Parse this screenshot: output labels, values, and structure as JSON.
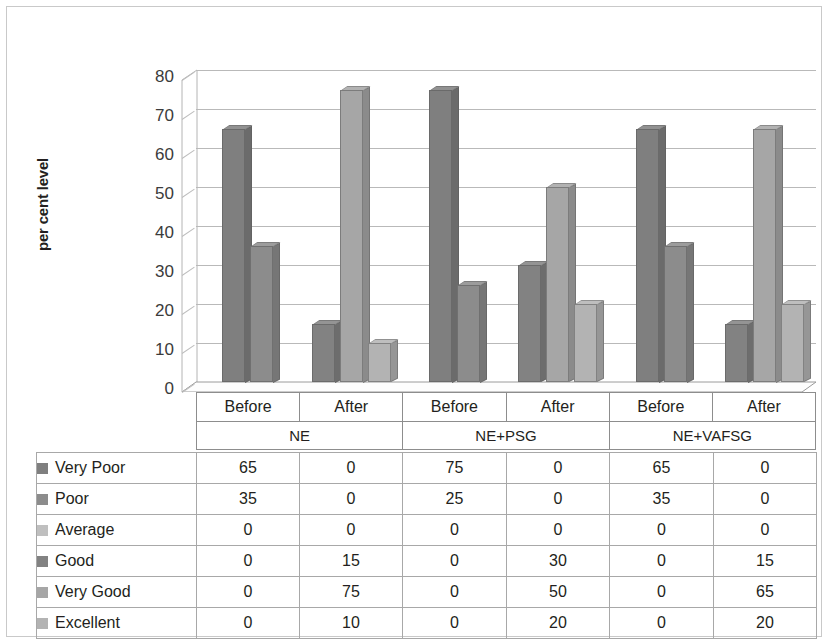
{
  "chart_data": {
    "type": "bar",
    "title": "",
    "subtitle": "",
    "xlabel": "",
    "ylabel": "per cent level",
    "ylim": [
      0,
      80
    ],
    "yticks": [
      0,
      10,
      20,
      30,
      40,
      50,
      60,
      70,
      80
    ],
    "grid": true,
    "legend_position": "data-table-below",
    "stacked": false,
    "three_d": true,
    "categories": [
      "Before",
      "After",
      "Before",
      "After",
      "Before",
      "After"
    ],
    "groups": [
      {
        "name": "NE",
        "categories": [
          "Before",
          "After"
        ]
      },
      {
        "name": "NE+PSG",
        "categories": [
          "Before",
          "After"
        ]
      },
      {
        "name": "NE+VAFSG",
        "categories": [
          "Before",
          "After"
        ]
      }
    ],
    "series": [
      {
        "name": "Very Poor",
        "color": "#7f7f7f",
        "values": [
          65,
          0,
          75,
          0,
          65,
          0
        ]
      },
      {
        "name": "Poor",
        "color": "#8c8c8c",
        "values": [
          35,
          0,
          25,
          0,
          35,
          0
        ]
      },
      {
        "name": "Average",
        "color": "#bfbfbf",
        "values": [
          0,
          0,
          0,
          0,
          0,
          0
        ]
      },
      {
        "name": "Good",
        "color": "#828282",
        "values": [
          0,
          15,
          0,
          30,
          0,
          15
        ]
      },
      {
        "name": "Very Good",
        "color": "#a6a6a6",
        "values": [
          0,
          75,
          0,
          50,
          0,
          65
        ]
      },
      {
        "name": "Excellent",
        "color": "#b3b3b3",
        "values": [
          0,
          10,
          0,
          20,
          0,
          20
        ]
      }
    ]
  },
  "axis": {
    "y_title": "per cent level",
    "y_tick_labels": [
      "80",
      "70",
      "60",
      "50",
      "40",
      "30",
      "20",
      "10",
      "0"
    ],
    "category_labels": [
      "Before",
      "After",
      "Before",
      "After",
      "Before",
      "After"
    ],
    "group_labels": [
      "NE",
      "NE+PSG",
      "NE+VAFSG"
    ]
  },
  "table": {
    "rows": [
      {
        "label": "Very Poor",
        "swatch": "#7f7f7f",
        "values": [
          "65",
          "0",
          "75",
          "0",
          "65",
          "0"
        ]
      },
      {
        "label": "Poor",
        "swatch": "#8c8c8c",
        "values": [
          "35",
          "0",
          "25",
          "0",
          "35",
          "0"
        ]
      },
      {
        "label": "Average",
        "swatch": "#bfbfbf",
        "values": [
          "0",
          "0",
          "0",
          "0",
          "0",
          "0"
        ]
      },
      {
        "label": "Good",
        "swatch": "#828282",
        "values": [
          "0",
          "15",
          "0",
          "30",
          "0",
          "15"
        ]
      },
      {
        "label": "Very Good",
        "swatch": "#a6a6a6",
        "values": [
          "0",
          "75",
          "0",
          "50",
          "0",
          "65"
        ]
      },
      {
        "label": "Excellent",
        "swatch": "#b3b3b3",
        "values": [
          "0",
          "10",
          "0",
          "20",
          "0",
          "20"
        ]
      }
    ]
  }
}
